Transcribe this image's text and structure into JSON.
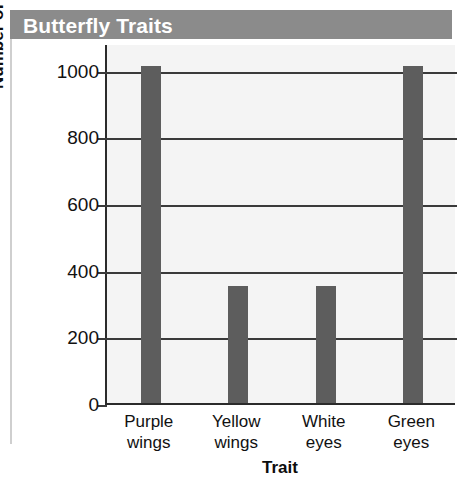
{
  "figure": {
    "title": "Butterfly Traits",
    "title_band_color": "#8b8b8b",
    "title_text_color": "#ffffff",
    "plot_background": "#f4f4f4",
    "bar_color": "#5d5d5d"
  },
  "chart_data": {
    "type": "bar",
    "title": "Butterfly Traits",
    "xlabel": "Trait",
    "ylabel": "Number of Butterflies",
    "categories": [
      "Purple wings",
      "Yellow wings",
      "White eyes",
      "Green eyes"
    ],
    "category_lines": [
      [
        "Purple",
        "wings"
      ],
      [
        "Yellow",
        "wings"
      ],
      [
        "White",
        "eyes"
      ],
      [
        "Green",
        "eyes"
      ]
    ],
    "values": [
      1010,
      350,
      350,
      1010
    ],
    "ylim": [
      0,
      1080
    ],
    "yticks": [
      0,
      200,
      400,
      600,
      800,
      1000
    ],
    "ytick_labels": [
      "0",
      "200",
      "400",
      "600",
      "800",
      "1000"
    ],
    "grid": true,
    "legend": null
  }
}
